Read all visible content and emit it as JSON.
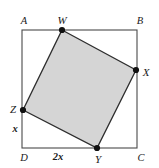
{
  "figure": {
    "type": "geometry-diagram",
    "width": 159,
    "height": 168,
    "background_color": "#ffffff",
    "shaded_fill_color": "#d5d5d5",
    "stroke_color": "#3a3a3a",
    "point_marker_color": "#111111",
    "outer_square": {
      "name": "ABCD",
      "corners": [
        {
          "label": "A",
          "x": 22,
          "y": 30,
          "label_x": 24,
          "label_y": 21
        },
        {
          "label": "B",
          "x": 137,
          "y": 30,
          "label_x": 140,
          "label_y": 21
        },
        {
          "label": "C",
          "x": 137,
          "y": 148,
          "label_x": 141,
          "label_y": 158
        },
        {
          "label": "D",
          "x": 22,
          "y": 148,
          "label_x": 24,
          "label_y": 158
        }
      ]
    },
    "inner_square": {
      "name": "WXYZ",
      "vertices": [
        {
          "label": "W",
          "x": 62,
          "y": 30,
          "label_x": 62,
          "label_y": 20,
          "on_side": "AB"
        },
        {
          "label": "X",
          "x": 136,
          "y": 70,
          "label_x": 146,
          "label_y": 72,
          "on_side": "BC"
        },
        {
          "label": "Y",
          "x": 97,
          "y": 148,
          "label_x": 98,
          "label_y": 159,
          "on_side": "DC"
        },
        {
          "label": "Z",
          "x": 23,
          "y": 110,
          "label_x": 13,
          "label_y": 109,
          "on_side": "AD"
        }
      ]
    },
    "measurements": [
      {
        "label": "x",
        "segment": "ZD",
        "label_x": 15,
        "label_y": 129
      },
      {
        "label": "2x",
        "segment": "DY",
        "label_x": 58,
        "label_y": 157
      }
    ]
  }
}
